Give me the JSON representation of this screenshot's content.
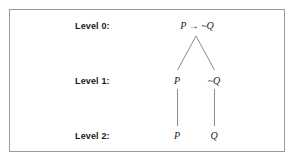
{
  "figure": {
    "kind": "truth-tree-diagram",
    "background_color": "#ffffff",
    "border_color": "#9a9a9a",
    "text_color": "#1a1a1a",
    "line_color": "#8d8d8d"
  },
  "levels": [
    {
      "label": "Level 0:"
    },
    {
      "label": "Level 1:"
    },
    {
      "label": "Level 2:"
    }
  ],
  "nodes": {
    "root": "P → ~Q",
    "level1_left": "P",
    "level1_right": "~Q",
    "level2_left": "P",
    "level2_right": "Q"
  }
}
